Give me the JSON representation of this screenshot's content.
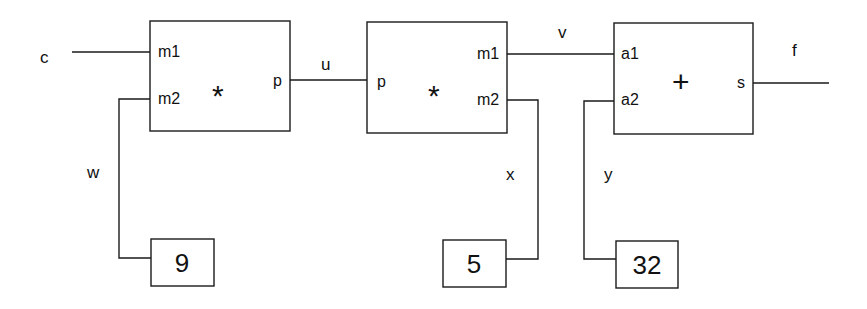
{
  "diagram": {
    "type": "dataflow-circuit",
    "blocks": [
      {
        "id": "mul1",
        "operator": "*",
        "inputs": [
          "m1",
          "m2"
        ],
        "output": "p"
      },
      {
        "id": "mul2",
        "operator": "*",
        "input": "p",
        "outputs": [
          "m1",
          "m2"
        ]
      },
      {
        "id": "add",
        "operator": "+",
        "inputs": [
          "a1",
          "a2"
        ],
        "output": "s"
      }
    ],
    "constants": [
      {
        "id": "const1",
        "value": "9"
      },
      {
        "id": "const2",
        "value": "5"
      },
      {
        "id": "const3",
        "value": "32"
      }
    ],
    "signals": {
      "c": "c",
      "w": "w",
      "u": "u",
      "v": "v",
      "x": "x",
      "y": "y",
      "f": "f"
    },
    "ports": {
      "mul1_m1": "m1",
      "mul1_m2": "m2",
      "mul1_p": "p",
      "mul2_p": "p",
      "mul2_m1": "m1",
      "mul2_m2": "m2",
      "add_a1": "a1",
      "add_a2": "a2",
      "add_s": "s"
    },
    "operators": {
      "mul1": "*",
      "mul2": "*",
      "add": "+"
    }
  }
}
